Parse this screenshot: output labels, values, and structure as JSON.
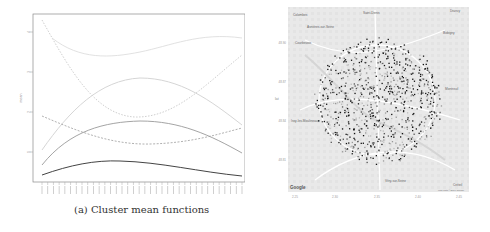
{
  "figure": {
    "panel_a": {
      "caption": "(a) Cluster mean functions",
      "ylabel": "mean",
      "y_ticks": [
        "1",
        "2",
        "3",
        "4"
      ],
      "x_tick_count": 36
    },
    "panel_b": {
      "caption": "(b) Map of clustered stations",
      "xlabel": "lon",
      "ylabel": "lat",
      "x_ticks": [
        "2.25",
        "2.30",
        "2.35",
        "2.40",
        "2.45"
      ],
      "y_ticks": [
        "48.90",
        "48.87",
        "48.84",
        "48.81"
      ],
      "place_labels": [
        "Colombes",
        "Asnières-sur-Seine",
        "Saint-Denis",
        "Courbevoie",
        "Bobigny",
        "Montreuil",
        "Issy-les-Moulineaux",
        "Vitry-sur-Seine",
        "Créteil",
        "Drancy"
      ],
      "attribution": "Map data ©2016 Google",
      "logo": "Google"
    }
  },
  "chart_data": [
    {
      "type": "line",
      "title": "Cluster mean functions",
      "xlabel": "",
      "ylabel": "mean",
      "x": [
        1,
        2,
        3,
        4,
        5,
        6,
        7,
        8,
        9,
        10,
        11,
        12,
        13,
        14,
        15,
        16,
        17,
        18,
        19,
        20,
        21,
        22,
        23,
        24,
        25,
        26,
        27,
        28,
        29,
        30,
        31,
        32,
        33,
        34,
        35,
        36
      ],
      "ylim": [
        0.3,
        4.3
      ],
      "series": [
        {
          "name": "cluster 1 (dotted, light)",
          "style": "dotted",
          "values_approx": [
            4.2,
            3.2,
            2.3,
            1.9,
            2.3,
            3.0,
            3.7
          ]
        },
        {
          "name": "cluster 2 (light)",
          "style": "solid-light",
          "values_approx": [
            3.6,
            3.4,
            3.3,
            3.4,
            3.5,
            3.7,
            3.7
          ]
        },
        {
          "name": "cluster 3 (light)",
          "style": "solid-light",
          "values_approx": [
            1.1,
            2.1,
            2.8,
            2.8,
            2.6,
            2.1,
            1.7
          ]
        },
        {
          "name": "cluster 4 (dashed)",
          "style": "dashed",
          "values_approx": [
            2.0,
            1.6,
            1.4,
            1.3,
            1.4,
            1.5,
            1.6
          ]
        },
        {
          "name": "cluster 5 (mid grey)",
          "style": "solid-mid",
          "values_approx": [
            0.8,
            1.5,
            1.8,
            1.8,
            1.6,
            1.3,
            1.0
          ]
        },
        {
          "name": "cluster 6 (dark)",
          "style": "solid-dark",
          "values_approx": [
            0.5,
            0.7,
            0.8,
            0.7,
            0.6,
            0.5,
            0.4
          ]
        }
      ],
      "grid": false,
      "legend": "none"
    },
    {
      "type": "scatter",
      "title": "Map of clustered stations",
      "xlabel": "lon",
      "ylabel": "lat",
      "xlim": [
        2.23,
        2.48
      ],
      "ylim": [
        48.79,
        48.92
      ],
      "description": "Velib stations over Paris map, colored by cluster (black / dark grey / light grey)"
    }
  ]
}
